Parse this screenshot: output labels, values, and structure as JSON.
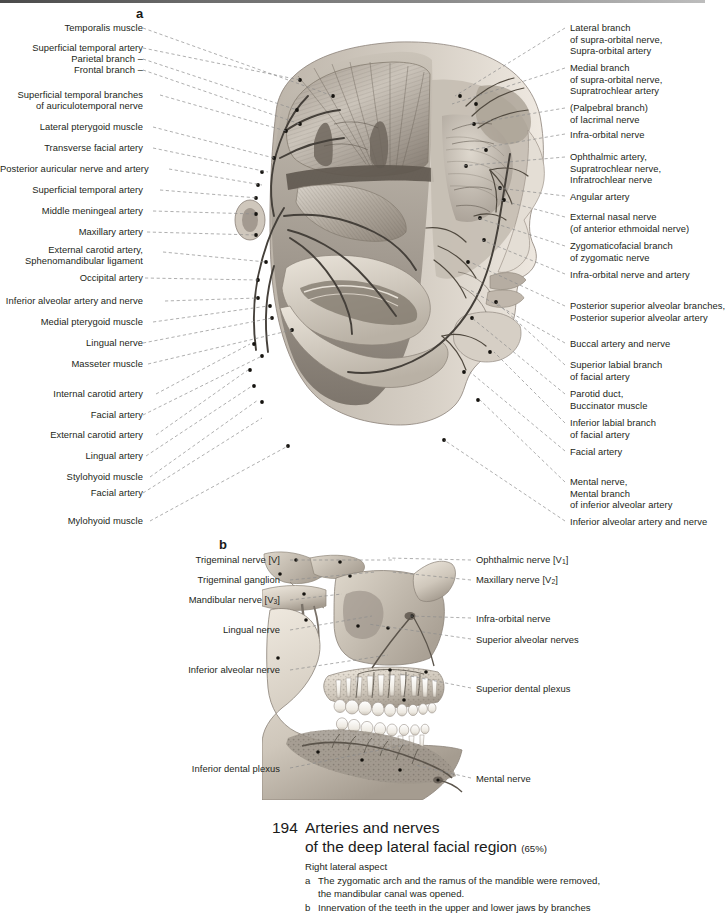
{
  "page": {
    "number": "194",
    "title_line1": "Arteries and nerves",
    "title_line2": "of the deep lateral facial region",
    "scale": "(65%)",
    "subtitle": "Right lateral aspect",
    "notes": [
      {
        "key": "a",
        "text": "The zygomatic arch and the ramus of the mandible were removed,\nthe mandibular canal was opened."
      },
      {
        "key": "b",
        "text": "Innervation of the teeth in the upper and lower jaws by branches"
      }
    ]
  },
  "panel_a": {
    "letter": "a",
    "labels_left": [
      {
        "text": "Temporalis muscle",
        "x": 28,
        "y": 22,
        "lx": 143,
        "ly": 28,
        "tx": 333,
        "ty": 96
      },
      {
        "text": "Superficial temporal artery",
        "x": 28,
        "y": 42,
        "lx": 143,
        "ly": 48,
        "tx": 300,
        "ty": 80
      },
      {
        "text": "Parietal branch –",
        "x": 28,
        "y": 53,
        "lx": 143,
        "ly": 59,
        "tx": 297,
        "ty": 110
      },
      {
        "text": "Frontal branch –",
        "x": 28,
        "y": 64,
        "lx": 143,
        "ly": 70,
        "tx": 300,
        "ty": 124
      },
      {
        "text": "Superficial temporal branches",
        "x": 28,
        "y": 89,
        "lx": 160,
        "ly": 95,
        "tx": 286,
        "ty": 131
      },
      {
        "text": "of auriculotemporal nerve",
        "x": 28,
        "y": 100,
        "lx": 0,
        "ly": 0,
        "tx": 0,
        "ty": 0
      },
      {
        "text": "Lateral pterygoid muscle",
        "x": 28,
        "y": 121,
        "lx": 153,
        "ly": 127,
        "tx": 274,
        "ty": 158
      },
      {
        "text": "Transverse facial artery",
        "x": 28,
        "y": 142,
        "lx": 153,
        "ly": 148,
        "tx": 268,
        "ty": 172
      },
      {
        "text": "Posterior auricular nerve and artery",
        "x": 28,
        "y": 163,
        "lx": 169,
        "ly": 169,
        "tx": 262,
        "ty": 185
      },
      {
        "text": "Superficial temporal artery",
        "x": 28,
        "y": 184,
        "lx": 160,
        "ly": 190,
        "tx": 258,
        "ty": 198
      },
      {
        "text": "Middle meningeal artery",
        "x": 28,
        "y": 205,
        "lx": 153,
        "ly": 211,
        "tx": 256,
        "ty": 214
      },
      {
        "text": "Maxillary artery",
        "x": 28,
        "y": 226,
        "lx": 147,
        "ly": 232,
        "tx": 256,
        "ty": 235
      },
      {
        "text": "External carotid artery,",
        "x": 28,
        "y": 244,
        "lx": 163,
        "ly": 252,
        "tx": 266,
        "ty": 262
      },
      {
        "text": "Sphenomandibular ligament",
        "x": 28,
        "y": 255,
        "lx": 0,
        "ly": 0,
        "tx": 0,
        "ty": 0
      },
      {
        "text": "Occipital artery",
        "x": 28,
        "y": 272,
        "lx": 145,
        "ly": 278,
        "tx": 258,
        "ty": 280
      },
      {
        "text": "Inferior alveolar artery and nerve",
        "x": 28,
        "y": 295,
        "lx": 165,
        "ly": 301,
        "tx": 258,
        "ty": 298
      },
      {
        "text": "Medial pterygoid muscle",
        "x": 28,
        "y": 316,
        "lx": 153,
        "ly": 322,
        "tx": 268,
        "ty": 306
      },
      {
        "text": "Lingual nerve",
        "x": 28,
        "y": 337,
        "lx": 143,
        "ly": 343,
        "tx": 272,
        "ty": 318
      },
      {
        "text": "Masseter muscle",
        "x": 28,
        "y": 358,
        "lx": 148,
        "ly": 364,
        "tx": 292,
        "ty": 330
      },
      {
        "text": "Internal carotid artery",
        "x": 28,
        "y": 388,
        "lx": 156,
        "ly": 394,
        "tx": 250,
        "ty": 344
      },
      {
        "text": "Facial artery",
        "x": 28,
        "y": 409,
        "lx": 143,
        "ly": 415,
        "tx": 262,
        "ty": 356
      },
      {
        "text": "External carotid artery",
        "x": 28,
        "y": 429,
        "lx": 156,
        "ly": 435,
        "tx": 248,
        "ty": 370
      },
      {
        "text": "Lingual artery",
        "x": 28,
        "y": 450,
        "lx": 146,
        "ly": 456,
        "tx": 252,
        "ty": 386
      },
      {
        "text": "Stylohyoid muscle",
        "x": 28,
        "y": 471,
        "lx": 150,
        "ly": 477,
        "tx": 258,
        "ty": 400
      },
      {
        "text": "Facial artery",
        "x": 28,
        "y": 487,
        "lx": 143,
        "ly": 493,
        "tx": 262,
        "ty": 418
      },
      {
        "text": "Mylohyoid muscle",
        "x": 28,
        "y": 515,
        "lx": 150,
        "ly": 521,
        "tx": 288,
        "ty": 446
      }
    ],
    "labels_right": [
      {
        "lines": [
          "Lateral branch",
          "of supra-orbital nerve,",
          "Supra-orbital artery"
        ],
        "x": 570,
        "y": 22,
        "lx": 565,
        "ly": 28,
        "tx": 455,
        "ty": 96
      },
      {
        "lines": [
          "Medial branch",
          "of supra-orbital nerve,",
          "Supratrochlear artery"
        ],
        "x": 570,
        "y": 62,
        "lx": 565,
        "ly": 68,
        "tx": 452,
        "ty": 104
      },
      {
        "lines": [
          "(Palpebral branch)",
          "of lacrimal nerve"
        ],
        "x": 570,
        "y": 102,
        "lx": 565,
        "ly": 108,
        "tx": 470,
        "ty": 124
      },
      {
        "lines": [
          "Infra-orbital nerve"
        ],
        "x": 570,
        "y": 129,
        "lx": 565,
        "ly": 134,
        "tx": 470,
        "ty": 150
      },
      {
        "lines": [
          "Ophthalmic artery,",
          "Supratrochlear nerve,",
          "Infratrochlear nerve"
        ],
        "x": 570,
        "y": 151,
        "lx": 565,
        "ly": 157,
        "tx": 462,
        "ty": 166
      },
      {
        "lines": [
          "Angular artery"
        ],
        "x": 570,
        "y": 191,
        "lx": 565,
        "ly": 196,
        "tx": 498,
        "ty": 188
      },
      {
        "lines": [
          "External nasal nerve",
          "(of anterior ethmoidal nerve)"
        ],
        "x": 570,
        "y": 211,
        "lx": 565,
        "ly": 217,
        "tx": 500,
        "ty": 200
      },
      {
        "lines": [
          "Zygomaticofacial branch",
          "of zygomatic nerve"
        ],
        "x": 570,
        "y": 240,
        "lx": 565,
        "ly": 246,
        "tx": 478,
        "ty": 218
      },
      {
        "lines": [
          "Infra-orbital nerve and artery"
        ],
        "x": 570,
        "y": 269,
        "lx": 565,
        "ly": 274,
        "tx": 482,
        "ty": 240
      },
      {
        "lines": [
          "Posterior superior alveolar branches,",
          "Posterior superior alveolar artery"
        ],
        "x": 570,
        "y": 300,
        "lx": 565,
        "ly": 306,
        "tx": 470,
        "ty": 262
      },
      {
        "lines": [
          "Buccal artery and nerve"
        ],
        "x": 570,
        "y": 338,
        "lx": 565,
        "ly": 343,
        "tx": 470,
        "ty": 290
      },
      {
        "lines": [
          "Superior labial branch",
          "of facial artery"
        ],
        "x": 570,
        "y": 359,
        "lx": 565,
        "ly": 365,
        "tx": 496,
        "ty": 302
      },
      {
        "lines": [
          "Parotid duct,",
          "Buccinator muscle"
        ],
        "x": 570,
        "y": 388,
        "lx": 565,
        "ly": 394,
        "tx": 472,
        "ty": 318
      },
      {
        "lines": [
          "Inferior labial branch",
          "of facial artery"
        ],
        "x": 570,
        "y": 417,
        "lx": 565,
        "ly": 423,
        "tx": 494,
        "ty": 352
      },
      {
        "lines": [
          "Facial artery"
        ],
        "x": 570,
        "y": 446,
        "lx": 565,
        "ly": 451,
        "tx": 470,
        "ty": 372
      },
      {
        "lines": [
          "Mental nerve,",
          "Mental branch",
          "of inferior alveolar artery"
        ],
        "x": 570,
        "y": 476,
        "lx": 565,
        "ly": 482,
        "tx": 480,
        "ty": 400
      },
      {
        "lines": [
          "Inferior alveolar artery and nerve"
        ],
        "x": 570,
        "y": 516,
        "lx": 565,
        "ly": 521,
        "tx": 444,
        "ty": 440
      }
    ]
  },
  "panel_b": {
    "letter": "b",
    "labels_left": [
      {
        "text": "Trigeminal nerve [V]",
        "x": 150,
        "y": 554,
        "lx": 290,
        "ly": 560,
        "tx": 395,
        "ty": 560
      },
      {
        "text": "Trigeminal ganglion",
        "x": 150,
        "y": 574,
        "lx": 290,
        "ly": 580,
        "tx": 375,
        "ty": 572
      },
      {
        "text": "Mandibular nerve [V3]",
        "x": 150,
        "y": 594,
        "lx": 290,
        "ly": 600,
        "tx": 342,
        "ty": 594,
        "sub": true
      },
      {
        "text": "Lingual nerve",
        "x": 150,
        "y": 624,
        "lx": 290,
        "ly": 630,
        "tx": 372,
        "ty": 616
      },
      {
        "text": "Inferior alveolar nerve",
        "x": 150,
        "y": 664,
        "lx": 290,
        "ly": 670,
        "tx": 388,
        "ty": 655
      },
      {
        "text": "Inferior dental plexus",
        "x": 150,
        "y": 763,
        "lx": 290,
        "ly": 768,
        "tx": 405,
        "ty": 745
      }
    ],
    "labels_right": [
      {
        "text": "Ophthalmic nerve [V1]",
        "x": 476,
        "y": 554,
        "lx": 471,
        "ly": 560,
        "tx": 388,
        "ty": 558,
        "sub": true
      },
      {
        "text": "Maxillary nerve [V2]",
        "x": 476,
        "y": 574,
        "lx": 471,
        "ly": 580,
        "tx": 392,
        "ty": 572,
        "sub": true
      },
      {
        "text": "Infra-orbital nerve",
        "x": 476,
        "y": 613,
        "lx": 471,
        "ly": 618,
        "tx": 410,
        "ty": 616
      },
      {
        "text": "Superior alveolar nerves",
        "x": 476,
        "y": 634,
        "lx": 471,
        "ly": 639,
        "tx": 368,
        "ty": 624
      },
      {
        "text": "Superior dental plexus",
        "x": 476,
        "y": 683,
        "lx": 471,
        "ly": 688,
        "tx": 400,
        "ty": 674
      },
      {
        "text": "Mental nerve",
        "x": 476,
        "y": 773,
        "lx": 471,
        "ly": 778,
        "tx": 415,
        "ty": 765
      }
    ]
  },
  "figure_a": {
    "caption_alt": "Dissection of the right deep lateral facial region, grayscale anatomical illustration",
    "region": {
      "x": 228,
      "y": 20,
      "w": 330,
      "h": 510
    }
  },
  "figure_b": {
    "caption_alt": "Right maxilla and mandible with teeth and dental nerve plexuses",
    "region": {
      "x": 262,
      "y": 548,
      "w": 235,
      "h": 250
    }
  },
  "colors": {
    "text": "#231f20",
    "leader": "#8d8d8d",
    "background": "#ffffff",
    "band": "#5a5a5a"
  }
}
